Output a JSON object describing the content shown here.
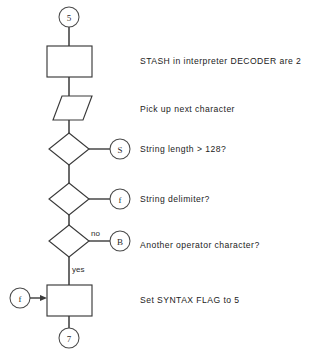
{
  "diagram": {
    "type": "flowchart",
    "background_color": "#ffffff",
    "line_color": "#3a3a3a",
    "text_color": "#222222",
    "nodes": [
      {
        "id": "conn-5",
        "shape": "connector",
        "label": "5"
      },
      {
        "id": "stash-box",
        "shape": "process",
        "label": ""
      },
      {
        "id": "pickup-io",
        "shape": "input-output",
        "label": ""
      },
      {
        "id": "len-diamond",
        "shape": "decision",
        "label": ""
      },
      {
        "id": "conn-s",
        "shape": "connector",
        "label": "S"
      },
      {
        "id": "delim-diamond",
        "shape": "decision",
        "label": ""
      },
      {
        "id": "conn-f-right",
        "shape": "connector",
        "label": "f"
      },
      {
        "id": "oper-diamond",
        "shape": "decision",
        "label": ""
      },
      {
        "id": "conn-b",
        "shape": "connector",
        "label": "B"
      },
      {
        "id": "conn-f-left",
        "shape": "connector",
        "label": "f"
      },
      {
        "id": "syntax-box",
        "shape": "process",
        "label": ""
      },
      {
        "id": "conn-7",
        "shape": "connector",
        "label": "7"
      }
    ],
    "branch_labels": {
      "operator_no": "no",
      "operator_yes": "yes"
    },
    "descriptions": [
      {
        "id": "desc-stash",
        "text": "STASH in interpreter DECODER are 2"
      },
      {
        "id": "desc-pickup",
        "text": "Pick up next character"
      },
      {
        "id": "desc-length",
        "text": "String length  >  128?"
      },
      {
        "id": "desc-delim",
        "text": "String delimiter?"
      },
      {
        "id": "desc-oper",
        "text": "Another operator character?"
      },
      {
        "id": "desc-syntax",
        "text": "Set SYNTAX FLAG to 5"
      }
    ]
  }
}
